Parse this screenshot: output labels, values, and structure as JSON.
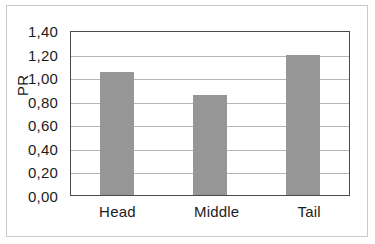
{
  "chart_data": {
    "type": "bar",
    "title": "",
    "xlabel": "",
    "ylabel": "PR",
    "categories": [
      "Head",
      "Middle",
      "Tail"
    ],
    "values": [
      1.045,
      0.845,
      1.185
    ],
    "ylim": [
      0,
      1.4
    ],
    "ytick_step": 0.2,
    "ytick_labels": [
      "0,00",
      "0,20",
      "0,40",
      "0,60",
      "0,80",
      "1,00",
      "1,20",
      "1,40"
    ],
    "ytick_values": [
      0,
      0.2,
      0.4,
      0.6,
      0.8,
      1.0,
      1.2,
      1.4
    ],
    "decimal_separator": ",",
    "grid": "horizontal",
    "legend": "none",
    "series": [
      {
        "name": "PR",
        "values": [
          1.045,
          0.845,
          1.185
        ],
        "color": "#969696"
      }
    ]
  },
  "style": {
    "bar_color": "#969696",
    "gridline_color": "#b6b6b6",
    "plot_border_color": "#4a4a4a",
    "outer_frame_color": "#c9c9c9",
    "text_color": "#1c1c1c",
    "background": "#ffffff"
  }
}
